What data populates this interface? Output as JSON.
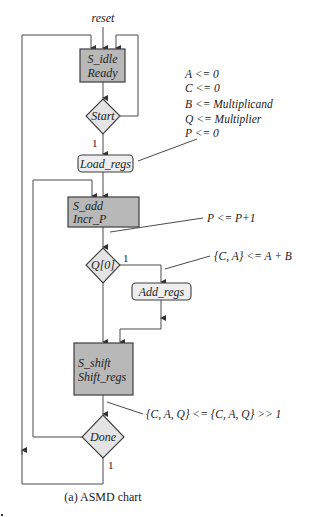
{
  "diagram": {
    "caption": "(a) ASMD chart",
    "reset_label": "reset",
    "colors": {
      "state_fill": "#b8b8b8",
      "decision_fill": "#e4e4e4",
      "conditional_box_fill": "#eeeeee",
      "line": "#4a4a4a"
    },
    "states": [
      {
        "id": "s_idle",
        "name": "S_idle",
        "output": "Ready"
      },
      {
        "id": "s_add",
        "name": "S_add",
        "output": "Incr_P"
      },
      {
        "id": "s_shift",
        "name": "S_shift",
        "output": "Shift_regs"
      }
    ],
    "decisions": [
      {
        "id": "start",
        "label": "Start",
        "true_label": "1"
      },
      {
        "id": "q0",
        "label": "Q[0]",
        "true_label": "1"
      },
      {
        "id": "done",
        "label": "Done",
        "true_label": "1"
      }
    ],
    "conditional_outputs": [
      {
        "id": "load_regs",
        "label": "Load_regs"
      },
      {
        "id": "add_regs",
        "label": "Add_regs"
      }
    ],
    "annotations": {
      "load_regs": [
        "A <= 0",
        "C <= 0",
        "B <= Multiplicand",
        "Q <= Multiplier",
        "P <= 0"
      ],
      "incr_p": "P <= P+1",
      "add_regs": "{C, A} <= A + B",
      "shift_regs": "{C, A, Q} <= {C, A, Q} >> 1"
    }
  }
}
